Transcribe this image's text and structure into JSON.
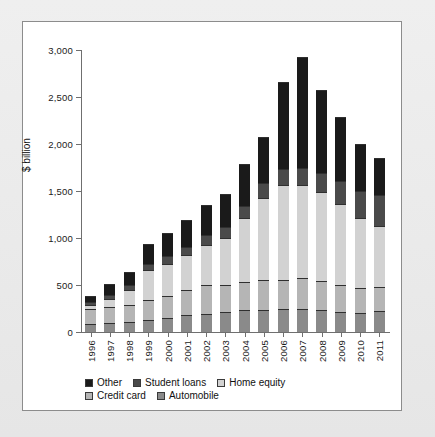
{
  "chart_data": {
    "type": "bar",
    "stacked": true,
    "title": "",
    "subtitle": "",
    "xlabel": "",
    "ylabel": "$ billion",
    "ylim": [
      0,
      3000
    ],
    "yticks": [
      0,
      500,
      1000,
      1500,
      2000,
      2500,
      3000
    ],
    "ytick_labels": [
      "0",
      "500",
      "1,000",
      "1,500",
      "2,000",
      "2,500",
      "3,000"
    ],
    "grid": false,
    "legend_position": "bottom-left",
    "categories": [
      "1996",
      "1997",
      "1998",
      "1999",
      "2000",
      "2001",
      "2002",
      "2003",
      "2004",
      "2005",
      "2006",
      "2007",
      "2008",
      "2009",
      "2010",
      "2011"
    ],
    "series": [
      {
        "name": "Automobile",
        "color": "#8a8a8a",
        "values": [
          85,
          95,
          105,
          130,
          145,
          180,
          195,
          215,
          230,
          235,
          240,
          245,
          235,
          215,
          205,
          225
        ]
      },
      {
        "name": "Credit card",
        "color": "#b5b5b5",
        "values": [
          155,
          170,
          185,
          210,
          235,
          265,
          300,
          285,
          300,
          315,
          315,
          330,
          310,
          290,
          265,
          250
        ]
      },
      {
        "name": "Home equity",
        "color": "#d2d2d2",
        "values": [
          45,
          85,
          155,
          315,
          340,
          370,
          435,
          505,
          680,
          880,
          1005,
          985,
          940,
          860,
          745,
          650
        ]
      },
      {
        "name": "Student loans",
        "color": "#4a4a4a",
        "values": [
          30,
          40,
          55,
          70,
          85,
          90,
          100,
          115,
          135,
          155,
          170,
          185,
          205,
          240,
          285,
          330
        ]
      },
      {
        "name": "Other",
        "color": "#1a1a1a",
        "values": [
          70,
          125,
          140,
          215,
          245,
          290,
          320,
          345,
          440,
          490,
          930,
          1180,
          885,
          685,
          505,
          400
        ]
      }
    ],
    "totals": [
      385,
      515,
      640,
      940,
      1050,
      1195,
      1350,
      1465,
      1785,
      2075,
      2660,
      2925,
      2575,
      2290,
      2005,
      1855
    ],
    "stack_order_bottom_to_top": [
      "Automobile",
      "Credit card",
      "Home equity",
      "Student loans",
      "Other"
    ]
  },
  "legend": {
    "rows": [
      [
        {
          "label": "Other",
          "color": "#1a1a1a"
        },
        {
          "label": "Student loans",
          "color": "#4a4a4a"
        },
        {
          "label": "Home equity",
          "color": "#d2d2d2"
        }
      ],
      [
        {
          "label": "Credit card",
          "color": "#b5b5b5"
        },
        {
          "label": "Automobile",
          "color": "#8a8a8a"
        }
      ]
    ]
  }
}
